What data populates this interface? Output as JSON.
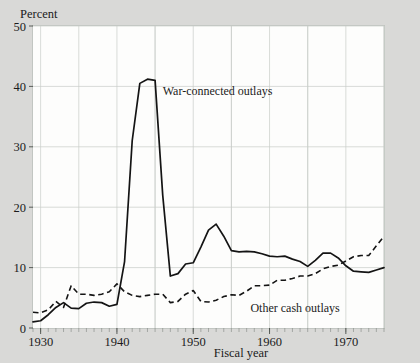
{
  "chart_data": {
    "type": "line",
    "title": "",
    "xlabel": "Fiscal year",
    "ylabel": "Percent",
    "unit_label": "Percent",
    "xlim": [
      1929,
      1975
    ],
    "ylim": [
      0,
      50
    ],
    "ytick_values": [
      0,
      10,
      20,
      30,
      40,
      50
    ],
    "ytick_labels": [
      "0",
      "10",
      "20",
      "30",
      "40",
      "50"
    ],
    "xtick_values": [
      1930,
      1940,
      1950,
      1960,
      1970
    ],
    "xtick_labels": [
      "1930",
      "1940",
      "1950",
      "1960",
      "1970"
    ],
    "x_minor_tick_step": 1,
    "grid": true,
    "legend_position": "inline-annotations",
    "annotations": [
      {
        "text": "War-connected outlays",
        "x": 1946,
        "y": 38.5
      },
      {
        "text": "Other cash outlays",
        "x": 1957.5,
        "y": 2.6
      }
    ],
    "x": [
      1929,
      1930,
      1931,
      1932,
      1933,
      1934,
      1935,
      1936,
      1937,
      1938,
      1939,
      1940,
      1941,
      1942,
      1943,
      1944,
      1945,
      1946,
      1947,
      1948,
      1949,
      1950,
      1951,
      1952,
      1953,
      1954,
      1955,
      1956,
      1957,
      1958,
      1959,
      1960,
      1961,
      1962,
      1963,
      1964,
      1965,
      1966,
      1967,
      1968,
      1969,
      1970,
      1971,
      1972,
      1973,
      1974,
      1975
    ],
    "series": [
      {
        "name": "War-connected outlays",
        "style": "solid",
        "values": [
          1.0,
          1.2,
          2.2,
          3.4,
          4.2,
          3.3,
          3.2,
          4.1,
          4.3,
          4.2,
          3.6,
          3.9,
          11.0,
          31.0,
          40.5,
          41.2,
          41.0,
          22.0,
          8.6,
          9.0,
          10.6,
          10.8,
          13.4,
          16.2,
          17.2,
          15.2,
          12.8,
          12.6,
          12.7,
          12.6,
          12.3,
          11.9,
          11.8,
          11.9,
          11.4,
          11.0,
          10.2,
          11.2,
          12.4,
          12.4,
          11.6,
          10.3,
          9.4,
          9.3,
          9.2,
          9.6,
          10.0
        ]
      },
      {
        "name": "Other cash outlays",
        "style": "dashed",
        "values": [
          2.6,
          2.5,
          3.0,
          4.4,
          3.4,
          7.0,
          5.6,
          5.6,
          5.4,
          5.6,
          6.0,
          7.3,
          6.0,
          5.4,
          5.2,
          5.4,
          5.6,
          5.6,
          4.2,
          4.4,
          5.6,
          6.2,
          4.4,
          4.3,
          4.6,
          5.2,
          5.5,
          5.4,
          6.1,
          7.0,
          7.0,
          7.1,
          7.9,
          7.9,
          8.2,
          8.6,
          8.6,
          9.0,
          9.8,
          10.2,
          10.4,
          11.1,
          11.8,
          12.0,
          12.0,
          13.6,
          15.2
        ]
      }
    ]
  },
  "figure": {
    "unit_caption": "Percent",
    "x_axis_title": "Fiscal year"
  }
}
